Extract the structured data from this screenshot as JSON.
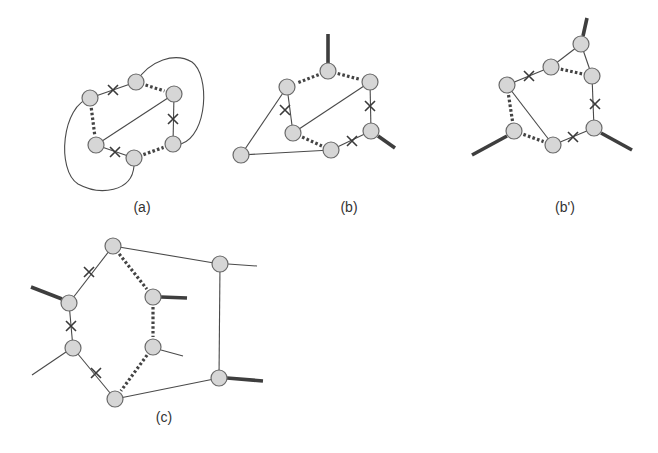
{
  "figure": {
    "panels": [
      {
        "id": "a",
        "label": "(a)",
        "label_pos": [
          142,
          212
        ],
        "nodes": [
          [
            90,
            98
          ],
          [
            136,
            82
          ],
          [
            174,
            94
          ],
          [
            96,
            145
          ],
          [
            134,
            158
          ],
          [
            173,
            144
          ]
        ],
        "solid_edges": [
          [
            0,
            1
          ],
          [
            2,
            5
          ],
          [
            3,
            4
          ],
          [
            3,
            2
          ]
        ],
        "dotted_edges": [
          [
            1,
            2
          ],
          [
            0,
            3
          ],
          [
            4,
            5
          ]
        ],
        "thick_stubs": [],
        "thin_stubs": [],
        "arcs": [
          "M136,82 C150,60 175,52 192,62 C210,75 208,135 181,144",
          "M90,98 C62,105 56,170 78,184 C100,196 132,192 134,166"
        ],
        "crosses": [
          [
            113,
            90
          ],
          [
            173,
            119
          ],
          [
            115,
            152
          ]
        ]
      },
      {
        "id": "b",
        "label": "(b)",
        "label_pos": [
          349,
          212
        ],
        "nodes": [
          [
            328,
            71
          ],
          [
            287,
            87
          ],
          [
            370,
            82
          ],
          [
            293,
            133
          ],
          [
            371,
            131
          ],
          [
            331,
            150
          ],
          [
            241,
            155
          ]
        ],
        "solid_edges": [
          [
            1,
            3
          ],
          [
            2,
            4
          ],
          [
            3,
            2
          ],
          [
            4,
            5
          ],
          [
            1,
            6
          ],
          [
            6,
            5
          ]
        ],
        "dotted_edges": [
          [
            0,
            1
          ],
          [
            0,
            2
          ],
          [
            3,
            5
          ]
        ],
        "thick_stubs": [
          [
            [
              328,
              63
            ],
            [
              328,
              34
            ]
          ],
          [
            [
              378,
              136
            ],
            [
              395,
              148
            ]
          ]
        ],
        "thin_stubs": [],
        "arcs": [],
        "crosses": [
          [
            285,
            110
          ],
          [
            370,
            106
          ],
          [
            352,
            141
          ]
        ]
      },
      {
        "id": "b_prime",
        "label": "(b')",
        "label_pos": [
          565,
          212
        ],
        "nodes": [
          [
            581,
            44
          ],
          [
            551,
            67
          ],
          [
            592,
            76
          ],
          [
            507,
            85
          ],
          [
            514,
            131
          ],
          [
            553,
            145
          ],
          [
            594,
            128
          ]
        ],
        "solid_edges": [
          [
            0,
            1
          ],
          [
            0,
            2
          ],
          [
            3,
            1
          ],
          [
            2,
            6
          ],
          [
            6,
            5
          ],
          [
            3,
            5
          ]
        ],
        "dotted_edges": [
          [
            1,
            2
          ],
          [
            3,
            4
          ],
          [
            4,
            5
          ]
        ],
        "thick_stubs": [
          [
            [
              583,
              36
            ],
            [
              587,
              18
            ]
          ],
          [
            [
              507,
              136
            ],
            [
              472,
              155
            ]
          ],
          [
            [
              601,
              133
            ],
            [
              632,
              150
            ]
          ]
        ],
        "thin_stubs": [],
        "arcs": [],
        "crosses": [
          [
            529,
            76
          ],
          [
            595,
            104
          ],
          [
            573,
            137
          ]
        ]
      },
      {
        "id": "c",
        "label": "(c)",
        "label_pos": [
          164,
          422
        ],
        "nodes": [
          [
            113,
            246
          ],
          [
            69,
            303
          ],
          [
            73,
            348
          ],
          [
            115,
            399
          ],
          [
            153,
            297
          ],
          [
            153,
            347
          ],
          [
            220,
            264
          ],
          [
            219,
            378
          ]
        ],
        "solid_edges": [
          [
            0,
            1
          ],
          [
            1,
            2
          ],
          [
            2,
            3
          ],
          [
            0,
            6
          ],
          [
            6,
            7
          ],
          [
            3,
            7
          ]
        ],
        "dotted_edges": [
          [
            0,
            4
          ],
          [
            4,
            5
          ],
          [
            5,
            3
          ]
        ],
        "thick_stubs": [
          [
            [
              62,
              299
            ],
            [
              31,
              287
            ]
          ],
          [
            [
              161,
              297
            ],
            [
              187,
              298
            ]
          ],
          [
            [
              227,
              378
            ],
            [
              263,
              381
            ]
          ]
        ],
        "thin_stubs": [
          [
            [
              66,
              352
            ],
            [
              32,
              375
            ]
          ],
          [
            [
              161,
              350
            ],
            [
              183,
              356
            ]
          ],
          [
            [
              228,
              264
            ],
            [
              257,
              266
            ]
          ]
        ],
        "arcs": [],
        "crosses": [
          [
            89,
            272
          ],
          [
            71,
            326
          ],
          [
            96,
            373
          ]
        ]
      }
    ],
    "node_radius": 8,
    "colors": {
      "node_fill": "#d6d6d6",
      "node_stroke": "#6a6a6a",
      "edge": "#444444",
      "background": "#ffffff"
    }
  }
}
